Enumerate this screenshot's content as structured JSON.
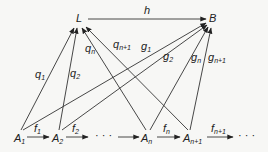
{
  "nodes": {
    "L": "L",
    "B": "B",
    "A1": {
      "base": "A",
      "sub": "1"
    },
    "A2": {
      "base": "A",
      "sub": "2"
    },
    "An": {
      "base": "A",
      "sub": "n"
    },
    "An1": {
      "base": "A",
      "sub": "n+1"
    },
    "dots1": "· · ·",
    "dots2": "· · ·"
  },
  "edges": {
    "h": "h",
    "q1": {
      "base": "q",
      "sub": "1"
    },
    "q2": {
      "base": "q",
      "sub": "2"
    },
    "qn": {
      "base": "q",
      "sub": "n"
    },
    "qn1": {
      "base": "q",
      "sub": "n+1"
    },
    "g1": {
      "base": "g",
      "sub": "1"
    },
    "g2": {
      "base": "g",
      "sub": "2"
    },
    "gn": {
      "base": "g",
      "sub": "n"
    },
    "gn1": {
      "base": "g",
      "sub": "n+1"
    },
    "f1": {
      "base": "f",
      "sub": "1"
    },
    "f2": {
      "base": "f",
      "sub": "2"
    },
    "fn": {
      "base": "f",
      "sub": "n"
    },
    "fn1": {
      "base": "f",
      "sub": "n+1"
    }
  }
}
